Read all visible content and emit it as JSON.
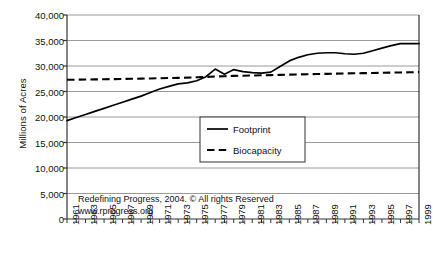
{
  "chart_data": {
    "type": "line",
    "title": "",
    "xlabel": "",
    "ylabel": "Millions of Acres",
    "ylim": [
      0,
      40000
    ],
    "xlim": [
      1961,
      1999
    ],
    "grid": true,
    "legend_position": "center",
    "ytick_labels": [
      "40,000",
      "35,000",
      "30,000",
      "25,000",
      "20,000",
      "15,000",
      "10,000",
      "5,000",
      "0"
    ],
    "ytick_values": [
      40000,
      35000,
      30000,
      25000,
      20000,
      15000,
      10000,
      5000,
      0
    ],
    "xtick_labels": [
      "1961",
      "1963",
      "1965",
      "1967",
      "1969",
      "1971",
      "1973",
      "1975",
      "1977",
      "1979",
      "1981",
      "1983",
      "1985",
      "1987",
      "1989",
      "1991",
      "1993",
      "1995",
      "1997",
      "1999"
    ],
    "x": [
      1961,
      1962,
      1963,
      1964,
      1965,
      1966,
      1967,
      1968,
      1969,
      1970,
      1971,
      1972,
      1973,
      1974,
      1975,
      1976,
      1977,
      1978,
      1979,
      1980,
      1981,
      1982,
      1983,
      1984,
      1985,
      1986,
      1987,
      1988,
      1989,
      1990,
      1991,
      1992,
      1993,
      1994,
      1995,
      1996,
      1997,
      1998,
      1999
    ],
    "series": [
      {
        "name": "Footprint",
        "style": "solid",
        "color": "#000000",
        "values": [
          19300,
          19900,
          20500,
          21100,
          21700,
          22300,
          22900,
          23500,
          24100,
          24800,
          25500,
          26000,
          26500,
          26700,
          27100,
          27900,
          29400,
          28400,
          29300,
          28900,
          28700,
          28600,
          28800,
          29900,
          31000,
          31700,
          32200,
          32500,
          32600,
          32600,
          32400,
          32300,
          32500,
          33000,
          33500,
          34000,
          34400,
          34400,
          34400
        ]
      },
      {
        "name": "Biocapacity",
        "style": "dashed",
        "color": "#000000",
        "values": [
          27300,
          27320,
          27340,
          27370,
          27400,
          27430,
          27460,
          27490,
          27520,
          27560,
          27600,
          27640,
          27680,
          27720,
          27780,
          27850,
          27930,
          28000,
          28060,
          28100,
          28140,
          28180,
          28220,
          28260,
          28300,
          28340,
          28380,
          28420,
          28460,
          28500,
          28540,
          28570,
          28600,
          28630,
          28670,
          28700,
          28740,
          28770,
          28800
        ]
      }
    ],
    "annotations": [
      "Redefining Progress, 2004. © All rights Reserved",
      "www.rprogress.org"
    ]
  },
  "legend": {
    "items": [
      {
        "label": "Footprint",
        "style": "solid"
      },
      {
        "label": "Biocapacity",
        "style": "dashed"
      }
    ]
  },
  "colors": {
    "line": "#000000",
    "grid": "#9a9a9a",
    "axis": "#333333",
    "background": "#ffffff"
  }
}
